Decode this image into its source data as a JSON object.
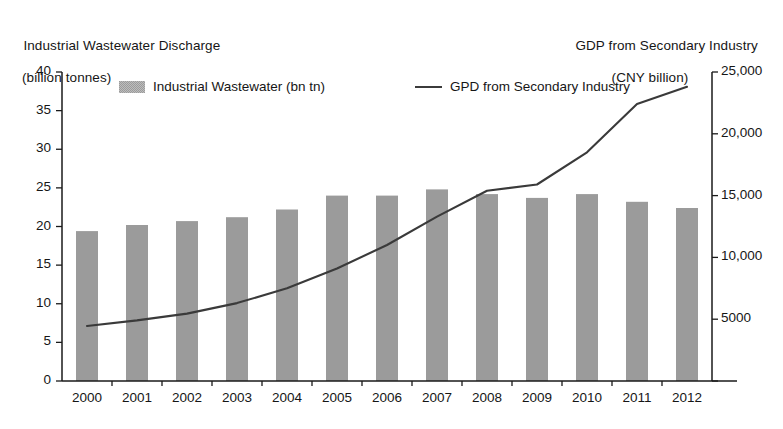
{
  "chart_data": {
    "type": "bar",
    "title": "",
    "categories": [
      "2000",
      "2001",
      "2002",
      "2003",
      "2004",
      "2005",
      "2006",
      "2007",
      "2008",
      "2009",
      "2010",
      "2011",
      "2012"
    ],
    "xlabel": "",
    "grid": false,
    "legend_position": "top",
    "series": [
      {
        "name": "Industrial Wastewater (bn tn)",
        "type": "bar",
        "axis": "left",
        "unit": "billion tonnes",
        "values": [
          19.4,
          20.2,
          20.7,
          21.2,
          22.2,
          24.0,
          24.0,
          24.8,
          24.2,
          23.7,
          24.2,
          23.2,
          22.4
        ]
      },
      {
        "name": "GPD from Secondary Industry",
        "type": "line",
        "axis": "right",
        "unit": "CNY billion",
        "values": [
          4450,
          4900,
          5450,
          6300,
          7500,
          9100,
          11000,
          13300,
          15400,
          15900,
          18500,
          22400,
          23800
        ]
      }
    ],
    "left_axis": {
      "title_line1": "Industrial Wastewater Discharge",
      "title_line2": "(billion tonnes)",
      "ylim": [
        0,
        40
      ],
      "tick_values": [
        0,
        5,
        10,
        15,
        20,
        25,
        30,
        35,
        40
      ],
      "tick_labels": [
        "0",
        "5",
        "10",
        "15",
        "20",
        "25",
        "30",
        "35",
        "40"
      ]
    },
    "right_axis": {
      "title_line1": "GDP from Secondary Industry",
      "title_line2": "(CNY billion)",
      "ylim": [
        0,
        25000
      ],
      "tick_values": [
        0,
        5000,
        10000,
        15000,
        20000,
        25000
      ],
      "tick_labels": [
        "",
        "5000",
        "10,000",
        "15,000",
        "20,000",
        "25,000"
      ]
    },
    "legend": [
      {
        "label": "Industrial Wastewater (bn tn)",
        "marker": "bar-swatch",
        "color": "#9b9b9b"
      },
      {
        "label": "GPD from Secondary Industry",
        "marker": "line-sample",
        "color": "#3a3a3a"
      }
    ],
    "colors": {
      "bar_fill": "#9b9b9b",
      "line_stroke": "#3a3a3a",
      "axis": "#1a1a1a",
      "background": "#ffffff",
      "text": "#161616"
    }
  }
}
